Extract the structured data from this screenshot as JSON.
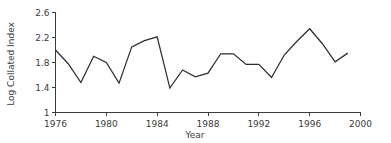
{
  "chart_data": {
    "type": "line",
    "title": "",
    "xlabel": "Year",
    "ylabel": "Log Collated Index",
    "xlim": [
      1976,
      2000
    ],
    "ylim": [
      1,
      2.6
    ],
    "grid": false,
    "legend": "none",
    "line_color": "#2e2e2e",
    "axis_color": "#3b3b3b",
    "x_ticks": [
      1976,
      1980,
      1984,
      1988,
      1992,
      1996,
      2000
    ],
    "x_tick_labels": [
      "1976",
      "1980",
      "1984",
      "1988",
      "1992",
      "1996",
      "2000"
    ],
    "y_ticks": [
      1,
      1.4,
      1.8,
      2.2,
      2.6
    ],
    "y_tick_labels": [
      "1",
      "1.4",
      "1.8",
      "2.2",
      "2.6"
    ],
    "x": [
      1976,
      1977,
      1978,
      1979,
      1980,
      1981,
      1982,
      1983,
      1984,
      1985,
      1986,
      1987,
      1988,
      1989,
      1990,
      1991,
      1992,
      1993,
      1994,
      1995,
      1996,
      1997,
      1998,
      1999
    ],
    "values": [
      2.0,
      1.78,
      1.48,
      1.9,
      1.8,
      1.47,
      2.05,
      2.15,
      2.21,
      1.39,
      1.68,
      1.57,
      1.63,
      1.94,
      1.94,
      1.77,
      1.77,
      1.56,
      1.92,
      2.14,
      2.34,
      2.1,
      1.81,
      1.95
    ],
    "series": [
      {
        "name": "Log Collated Index",
        "values": [
          2.0,
          1.78,
          1.48,
          1.9,
          1.8,
          1.47,
          2.05,
          2.15,
          2.21,
          1.39,
          1.68,
          1.57,
          1.63,
          1.94,
          1.94,
          1.77,
          1.77,
          1.56,
          1.92,
          2.14,
          2.34,
          2.1,
          1.81,
          1.95
        ]
      }
    ]
  }
}
